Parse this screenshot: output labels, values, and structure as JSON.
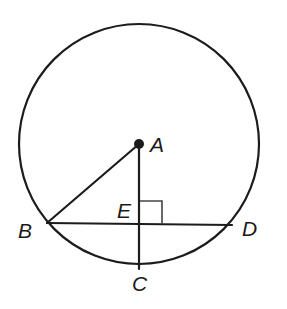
{
  "diagram": {
    "type": "geometry",
    "circle": {
      "center": "A",
      "cx": 139,
      "cy": 144,
      "r": 120
    },
    "points": {
      "A": {
        "label": "A",
        "x": 139,
        "y": 144
      },
      "B": {
        "label": "B",
        "x": 47,
        "y": 223
      },
      "C": {
        "label": "C",
        "x": 139,
        "y": 269
      },
      "D": {
        "label": "D",
        "x": 232,
        "y": 224
      },
      "E": {
        "label": "E",
        "x": 139,
        "y": 224
      }
    },
    "segments": [
      {
        "from": "A",
        "to": "B"
      },
      {
        "from": "B",
        "to": "D"
      },
      {
        "from": "A",
        "to": "C"
      }
    ],
    "right_angle_marker": {
      "at": "E",
      "size": 23
    },
    "colors": {
      "stroke": "#1c1c1c",
      "background": "#ffffff"
    }
  }
}
